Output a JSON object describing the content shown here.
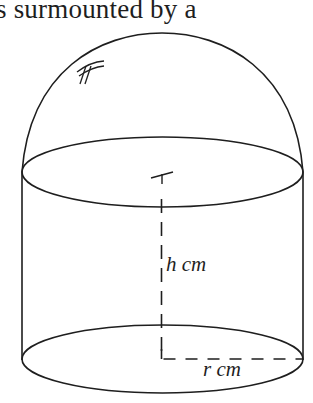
{
  "caption": {
    "text": "s surmounted by a"
  },
  "figure": {
    "stroke_color": "#1e1e1e",
    "labels": {
      "height": "h cm",
      "radius": "r cm"
    },
    "marks": {
      "hemisphere_hatch": "equal-length tick marks on hemisphere",
      "center_tick": "center tick mark on top circle"
    }
  }
}
